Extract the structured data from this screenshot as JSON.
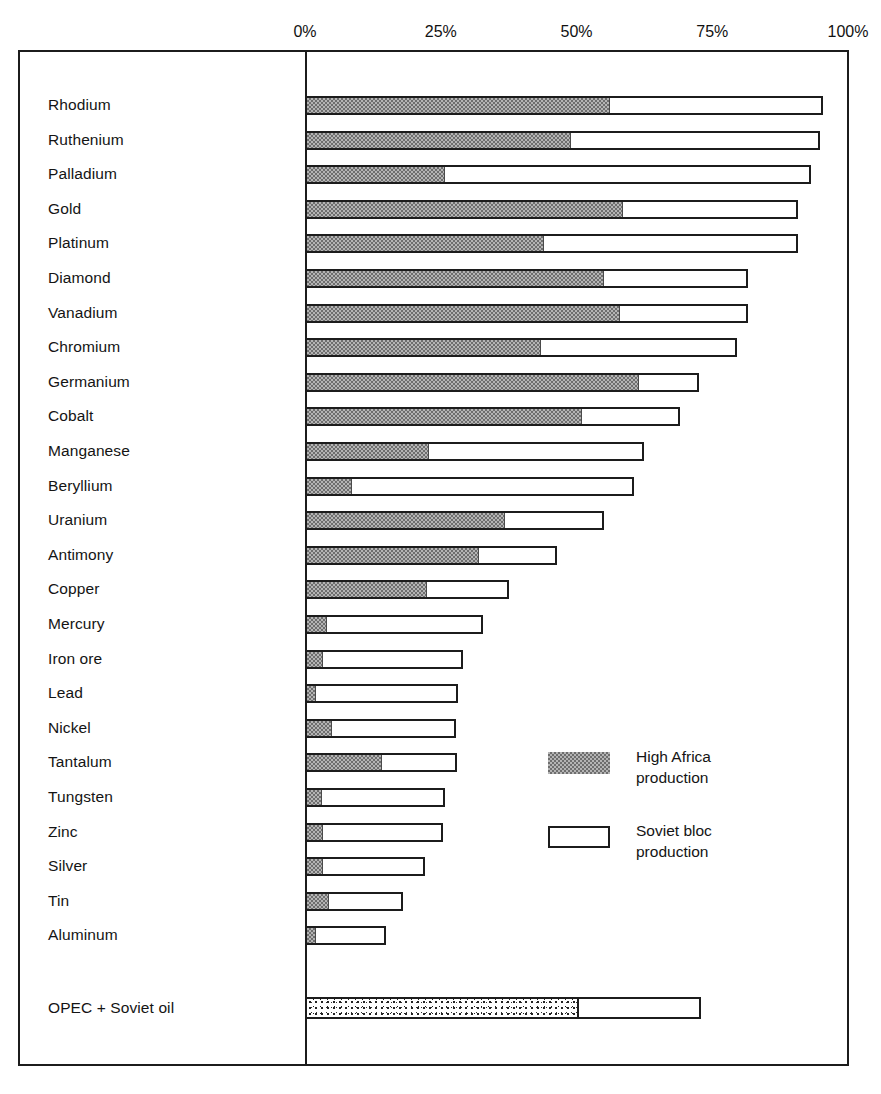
{
  "chart_data": {
    "type": "bar",
    "orientation": "horizontal",
    "stacked": true,
    "title": "",
    "xlabel": "",
    "ylabel": "",
    "xlim": [
      0,
      100
    ],
    "xticks": [
      "0%",
      "25%",
      "50%",
      "75%",
      "100%"
    ],
    "xtick_values": [
      0,
      25,
      50,
      75,
      100
    ],
    "grid": false,
    "legend_position": "inside-right",
    "series": [
      {
        "name": "High Africa production",
        "key": "africa",
        "pattern": "checkered-grey"
      },
      {
        "name": "Soviet bloc production",
        "key": "soviet",
        "pattern": "white-outline"
      }
    ],
    "categories": [
      "Rhodium",
      "Ruthenium",
      "Palladium",
      "Gold",
      "Platinum",
      "Diamond",
      "Vanadium",
      "Chromium",
      "Germanium",
      "Cobalt",
      "Manganese",
      "Beryllium",
      "Uranium",
      "Antimony",
      "Copper",
      "Mercury",
      "Iron  ore",
      "Lead",
      "Nickel",
      "Tantalum",
      "Tungsten",
      "Zinc",
      "Silver",
      "Tin",
      "Aluminum"
    ],
    "rows": [
      {
        "label": "Rhodium",
        "africa": 56.2,
        "total": 95.4
      },
      {
        "label": "Ruthenium",
        "africa": 49.0,
        "total": 94.8
      },
      {
        "label": "Palladium",
        "africa": 25.8,
        "total": 93.2
      },
      {
        "label": "Gold",
        "africa": 58.5,
        "total": 90.8
      },
      {
        "label": "Platinum",
        "africa": 44.0,
        "total": 90.8
      },
      {
        "label": "Diamond",
        "africa": 55.0,
        "total": 81.5
      },
      {
        "label": "Vanadium",
        "africa": 58.0,
        "total": 81.5
      },
      {
        "label": "Chromium",
        "africa": 43.5,
        "total": 79.5
      },
      {
        "label": "Germanium",
        "africa": 61.5,
        "total": 72.5
      },
      {
        "label": "Cobalt",
        "africa": 51.0,
        "total": 69.0
      },
      {
        "label": "Manganese",
        "africa": 22.8,
        "total": 62.5
      },
      {
        "label": "Beryllium",
        "africa": 8.6,
        "total": 60.5
      },
      {
        "label": "Uranium",
        "africa": 36.8,
        "total": 55.0
      },
      {
        "label": "Antimony",
        "africa": 32.0,
        "total": 46.5
      },
      {
        "label": "Copper",
        "africa": 22.4,
        "total": 37.5
      },
      {
        "label": "Mercury",
        "africa": 4.0,
        "total": 32.8
      },
      {
        "label": "Iron  ore",
        "africa": 3.3,
        "total": 29.1
      },
      {
        "label": "Lead",
        "africa": 2.0,
        "total": 28.2
      },
      {
        "label": "Nickel",
        "africa": 5.0,
        "total": 27.8
      },
      {
        "label": "Tantalum",
        "africa": 14.2,
        "total": 28.0
      },
      {
        "label": "Tungsten",
        "africa": 3.1,
        "total": 25.8
      },
      {
        "label": "Zinc",
        "africa": 3.3,
        "total": 25.4
      },
      {
        "label": "Silver",
        "africa": 3.3,
        "total": 22.1
      },
      {
        "label": "Tin",
        "africa": 4.4,
        "total": 18.0
      },
      {
        "label": "Aluminum",
        "africa": 2.0,
        "total": 14.9
      }
    ],
    "footer_row": {
      "label": "OPEC  +  Soviet oil",
      "opec": 50.5,
      "total": 73.0,
      "pattern": "stipple"
    },
    "colors": {
      "africa_fill": "#b4b4b4",
      "africa_hatch": "#6e6e6e",
      "soviet_fill": "#ffffff",
      "outline": "#1c1c1c",
      "text": "#141414",
      "background": "#ffffff"
    }
  },
  "axis": {
    "ticks": [
      {
        "label": "0%",
        "value": 0
      },
      {
        "label": "25%",
        "value": 25
      },
      {
        "label": "50%",
        "value": 50
      },
      {
        "label": "75%",
        "value": 75
      },
      {
        "label": "100%",
        "value": 100
      }
    ]
  },
  "legend": {
    "entries": [
      {
        "label": "High  Africa\nproduction",
        "swatch": "africa"
      },
      {
        "label": "Soviet  bloc\nproduction",
        "swatch": "soviet"
      }
    ]
  },
  "rows": {
    "0": {
      "label": "Rhodium"
    },
    "1": {
      "label": "Ruthenium"
    },
    "2": {
      "label": "Palladium"
    },
    "3": {
      "label": "Gold"
    },
    "4": {
      "label": "Platinum"
    },
    "5": {
      "label": "Diamond"
    },
    "6": {
      "label": "Vanadium"
    },
    "7": {
      "label": "Chromium"
    },
    "8": {
      "label": "Germanium"
    },
    "9": {
      "label": "Cobalt"
    },
    "10": {
      "label": "Manganese"
    },
    "11": {
      "label": "Beryllium"
    },
    "12": {
      "label": "Uranium"
    },
    "13": {
      "label": "Antimony"
    },
    "14": {
      "label": "Copper"
    },
    "15": {
      "label": "Mercury"
    },
    "16": {
      "label": "Iron  ore"
    },
    "17": {
      "label": "Lead"
    },
    "18": {
      "label": "Nickel"
    },
    "19": {
      "label": "Tantalum"
    },
    "20": {
      "label": "Tungsten"
    },
    "21": {
      "label": "Zinc"
    },
    "22": {
      "label": "Silver"
    },
    "23": {
      "label": "Tin"
    },
    "24": {
      "label": "Aluminum"
    }
  },
  "footer": {
    "label": "OPEC  +  Soviet oil"
  }
}
